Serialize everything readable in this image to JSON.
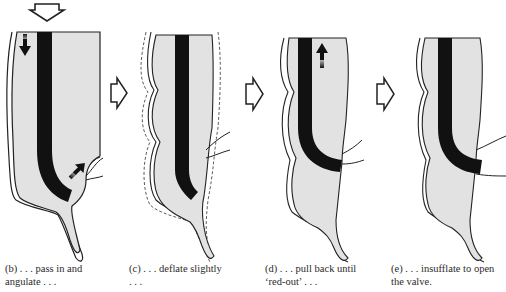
{
  "figure": {
    "colors": {
      "lumen_fill": "#e2e2e2",
      "wall_stroke": "#222222",
      "scope": "#111111",
      "background": "#ffffff"
    },
    "panels": [
      {
        "id": "b",
        "caption_line1": "(b) . . . pass in and",
        "caption_line2": "angulate . . ."
      },
      {
        "id": "c",
        "caption_line1": "(c) . . . deflate slightly",
        "caption_line2": ". . ."
      },
      {
        "id": "d",
        "caption_line1": "(d) . . . pull back until",
        "caption_line2": "‘red-out’ . . ."
      },
      {
        "id": "e",
        "caption_line1": "(e) . . . insufflate to open",
        "caption_line2": "the valve."
      }
    ],
    "icons": {
      "entry_arrow": "hollow-down-arrow",
      "step_arrow": "hollow-right-arrow",
      "motion_down": "solid-down-arrow",
      "motion_up": "solid-up-arrow",
      "motion_angulate": "solid-diagonal-arrow"
    }
  }
}
